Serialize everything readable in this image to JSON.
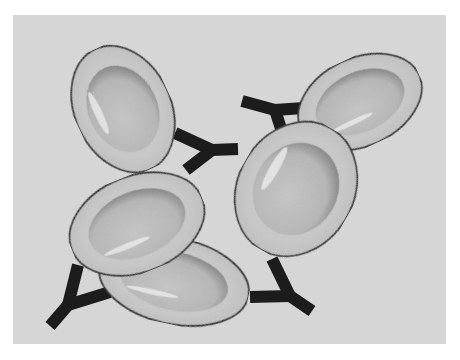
{
  "figure": {
    "colors": {
      "background": "#ffffff",
      "panel": "#d6d6d6",
      "cell_fill": "#c9c9c9",
      "cell_inner": "#bcbcbc",
      "cell_shadow": "#8a8a8a",
      "cell_outline": "#1a1a1a",
      "cell_highlight": "#ececec",
      "antibody": "#1c1c1c"
    },
    "cells": [
      {
        "id": "cell-top-left",
        "cx": 123,
        "cy": 109,
        "rx": 48,
        "ry": 66,
        "rotate": -25
      },
      {
        "id": "cell-bottom-left",
        "cx": 174,
        "cy": 281,
        "rx": 76,
        "ry": 43,
        "rotate": 12
      },
      {
        "id": "cell-middle-left",
        "cx": 137,
        "cy": 224,
        "rx": 70,
        "ry": 48,
        "rotate": -22
      },
      {
        "id": "cell-top-right",
        "cx": 360,
        "cy": 102,
        "rx": 65,
        "ry": 44,
        "rotate": -25
      },
      {
        "id": "cell-middle-right",
        "cx": 296,
        "cy": 189,
        "rx": 58,
        "ry": 70,
        "rotate": 30
      }
    ],
    "antibodies": [
      {
        "id": "antibody-top-center",
        "arm1": [
          [
            175,
            133
          ],
          [
            212,
            150
          ]
        ],
        "arm2": [
          [
            212,
            150
          ],
          [
            186,
            170
          ]
        ],
        "stem": [
          [
            212,
            150
          ],
          [
            238,
            149
          ]
        ]
      },
      {
        "id": "antibody-top-right",
        "arm1": [
          [
            242,
            101
          ],
          [
            275,
            110
          ]
        ],
        "arm2": [
          [
            275,
            110
          ],
          [
            284,
            138
          ]
        ],
        "stem": [
          [
            275,
            110
          ],
          [
            304,
            108
          ]
        ]
      },
      {
        "id": "antibody-bottom-left",
        "arm1": [
          [
            78,
            265
          ],
          [
            68,
            305
          ]
        ],
        "arm2": [
          [
            68,
            305
          ],
          [
            110,
            292
          ]
        ],
        "stem": [
          [
            68,
            305
          ],
          [
            50,
            326
          ]
        ]
      },
      {
        "id": "antibody-bottom-right",
        "arm1": [
          [
            272,
            259
          ],
          [
            290,
            296
          ]
        ],
        "arm2": [
          [
            290,
            296
          ],
          [
            250,
            297
          ]
        ],
        "stem": [
          [
            290,
            296
          ],
          [
            312,
            311
          ]
        ]
      }
    ]
  }
}
